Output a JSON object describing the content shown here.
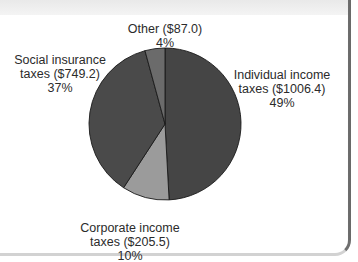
{
  "chart_data": {
    "type": "pie",
    "title": "",
    "units": "dollars (values shown in parentheses)",
    "start_angle_deg": 0,
    "direction": "clockwise",
    "slices": [
      {
        "label": "Individual income taxes",
        "value": 1006.4,
        "percent": 49,
        "color": "#454545"
      },
      {
        "label": "Corporate income taxes",
        "value": 205.5,
        "percent": 10,
        "color": "#9b9b9b"
      },
      {
        "label": "Social insurance taxes",
        "value": 749.2,
        "percent": 37,
        "color": "#4a4a4a"
      },
      {
        "label": "Other",
        "value": 87.0,
        "percent": 4,
        "color": "#6b6b6b"
      }
    ],
    "categories": [
      "Individual income taxes",
      "Corporate income taxes",
      "Social insurance taxes",
      "Other"
    ],
    "values": [
      1006.4,
      205.5,
      749.2,
      87.0
    ],
    "legend": "none (direct labels)"
  },
  "labels": {
    "individual": {
      "line1": "Individual income",
      "line2": "taxes ($1006.4)",
      "line3": "49%"
    },
    "corporate": {
      "line1": "Corporate income",
      "line2": "taxes ($205.5)",
      "line3": "10%"
    },
    "social": {
      "line1": "Social insurance",
      "line2": "taxes ($749.2)",
      "line3": "37%"
    },
    "other": {
      "line1": "Other ($87.0)",
      "line2": "4%"
    }
  },
  "colors": {
    "outline": "#1a1a1a",
    "panel_border": "#6f6f6f",
    "top_band": "#ececec"
  }
}
